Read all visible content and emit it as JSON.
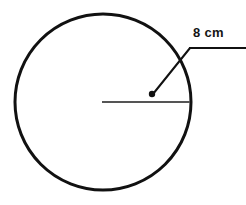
{
  "figure": {
    "background_color": "#ffffff",
    "shape": {
      "name": "circle",
      "stroke_color": "#111111",
      "stroke_width": 3,
      "fill": "none",
      "center_x": 103,
      "center_y": 102,
      "radius": 88
    },
    "radius_line": {
      "name": "radius-segment",
      "stroke_color": "#555555",
      "stroke_width": 2,
      "x1": 102,
      "y1": 102,
      "x2": 190,
      "y2": 102
    },
    "leader": {
      "name": "leader-line",
      "stroke_color": "#111111",
      "stroke_width": 2,
      "diagonal": {
        "x1": 153,
        "y1": 94,
        "x2": 190,
        "y2": 48
      },
      "horizontal": {
        "x1": 189,
        "y1": 48,
        "x2": 246,
        "y2": 48
      }
    },
    "point_marker": {
      "name": "radius-point",
      "color": "#111111",
      "x": 152,
      "y": 94,
      "radius": 3.2
    },
    "label": {
      "text": "8 cm",
      "color": "#141414",
      "x": 193,
      "y": 26
    }
  }
}
